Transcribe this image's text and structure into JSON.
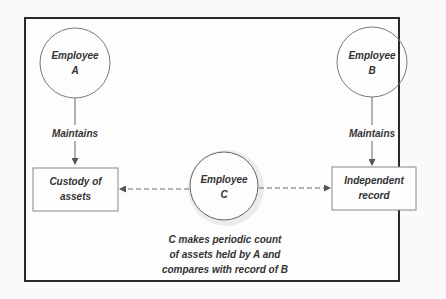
{
  "diagram": {
    "nodes": {
      "employee_a": {
        "line1": "Employee",
        "line2": "A"
      },
      "employee_b": {
        "line1": "Employee",
        "line2": "B"
      },
      "employee_c": {
        "line1": "Employee",
        "line2": "C"
      },
      "custody": {
        "line1": "Custody of",
        "line2": "assets"
      },
      "record": {
        "line1": "Independent",
        "line2": "record"
      }
    },
    "edges": {
      "a_to_custody": "Maintains",
      "b_to_record": "Maintains"
    },
    "caption": {
      "line1": "C makes periodic count",
      "line2": "of assets held by A and",
      "line3": "compares with record of B"
    },
    "colors": {
      "stroke": "#555555",
      "frame": "#2a2a2a",
      "text": "#333333",
      "halo": "#e4e4e4"
    }
  }
}
